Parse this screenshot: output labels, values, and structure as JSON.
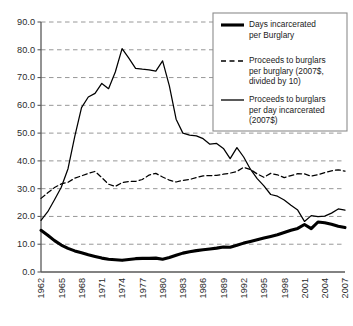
{
  "chart_data": {
    "type": "line",
    "title": "",
    "subtitle": "",
    "xlabel": "",
    "ylabel": "",
    "xlim": [
      1962,
      2007
    ],
    "ylim": [
      0.0,
      90.0
    ],
    "grid": true,
    "legend_position": "top-right",
    "y_ticks": [
      "0.0",
      "10.0",
      "20.0",
      "30.0",
      "40.0",
      "50.0",
      "60.0",
      "70.0",
      "80.0",
      "90.0"
    ],
    "y_tick_values": [
      0,
      10,
      20,
      30,
      40,
      50,
      60,
      70,
      80,
      90
    ],
    "x_ticks": [
      "1962",
      "1965",
      "1968",
      "1971",
      "1974",
      "1977",
      "1980",
      "1983",
      "1986",
      "1989",
      "1992",
      "1995",
      "1998",
      "2001",
      "2004",
      "2007"
    ],
    "x_tick_values": [
      1962,
      1965,
      1968,
      1971,
      1974,
      1977,
      1980,
      1983,
      1986,
      1989,
      1992,
      1995,
      1998,
      2001,
      2004,
      2007
    ],
    "x": [
      1962,
      1963,
      1964,
      1965,
      1966,
      1967,
      1968,
      1969,
      1970,
      1971,
      1972,
      1973,
      1974,
      1975,
      1976,
      1977,
      1978,
      1979,
      1980,
      1981,
      1982,
      1983,
      1984,
      1985,
      1986,
      1987,
      1988,
      1989,
      1990,
      1991,
      1992,
      1993,
      1994,
      1995,
      1996,
      1997,
      1998,
      1999,
      2000,
      2001,
      2002,
      2003,
      2004,
      2005,
      2006,
      2007
    ],
    "series": [
      {
        "name": "Days incarcerated per Burglary",
        "style": "thick-solid",
        "color": "#000000",
        "values": [
          15.0,
          13.2,
          11.3,
          9.7,
          8.5,
          7.6,
          6.9,
          6.2,
          5.6,
          5.0,
          4.6,
          4.4,
          4.2,
          4.5,
          4.8,
          4.9,
          4.9,
          5.0,
          4.6,
          5.2,
          6.0,
          6.8,
          7.3,
          7.7,
          8.0,
          8.3,
          8.6,
          9.0,
          8.9,
          9.6,
          10.4,
          11.0,
          11.6,
          12.2,
          12.8,
          13.4,
          14.2,
          15.0,
          15.7,
          17.1,
          15.6,
          18.0,
          17.7,
          17.2,
          16.5,
          16.0
        ]
      },
      {
        "name": "Proceeds to burglars per burglary (2007$, divided by 10)",
        "style": "dashed",
        "color": "#000000",
        "values": [
          26.5,
          28.5,
          30.4,
          31.7,
          32.3,
          33.8,
          34.6,
          35.5,
          36.2,
          34.0,
          31.6,
          30.8,
          32.2,
          32.6,
          32.6,
          33.3,
          34.9,
          35.5,
          34.2,
          33.1,
          32.4,
          33.0,
          33.3,
          34.0,
          34.6,
          34.7,
          34.8,
          35.2,
          35.6,
          36.2,
          37.7,
          36.9,
          35.3,
          34.1,
          35.5,
          35.0,
          34.0,
          34.7,
          35.4,
          35.3,
          34.5,
          35.0,
          35.8,
          36.4,
          36.8,
          36.3
        ]
      },
      {
        "name": "Proceeds to burglars per day incarcerated (2007$)",
        "style": "thin-solid",
        "color": "#000000",
        "values": [
          18.6,
          21.7,
          26.0,
          30.5,
          37.2,
          48.8,
          59.2,
          63.0,
          64.3,
          67.9,
          66.0,
          72.0,
          80.4,
          77.0,
          73.3,
          73.0,
          72.8,
          72.3,
          76.0,
          67.0,
          55.0,
          50.0,
          49.3,
          49.0,
          48.0,
          46.0,
          46.3,
          44.5,
          40.8,
          44.8,
          41.4,
          37.0,
          33.6,
          31.0,
          27.9,
          27.3,
          25.9,
          24.0,
          22.3,
          18.2,
          20.3,
          19.9,
          20.1,
          21.2,
          22.7,
          22.3
        ]
      }
    ],
    "legend": [
      {
        "line1": "Days incarcerated",
        "line2": "per Burglary",
        "line3": "",
        "style": "thick-solid"
      },
      {
        "line1": "Proceeds to burglars",
        "line2": "per burglary (2007$,",
        "line3": "divided by 10)",
        "style": "dashed"
      },
      {
        "line1": "Proceeds to burglars",
        "line2": "per day incarcerated",
        "line3": "(2007$)",
        "style": "thin-solid"
      }
    ],
    "colors": {
      "axis": "#595959",
      "grid": "#8c8c8c",
      "line": "#000000",
      "legend_border": "#8c8c8c",
      "background": "#ffffff"
    }
  }
}
